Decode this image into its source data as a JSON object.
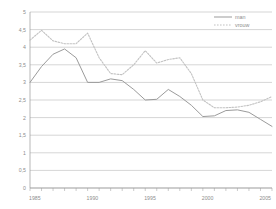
{
  "chart_data": {
    "type": "line",
    "title": "",
    "xlabel": "",
    "ylabel": "",
    "xlim": [
      1985,
      2006
    ],
    "ylim": [
      0,
      5
    ],
    "ytick_step": 0.5,
    "grid": true,
    "legend_position": "top-right",
    "ytick_labels": [
      "5",
      "4,5",
      "4",
      "3,5",
      "3",
      "2,5",
      "2",
      "1,5",
      "1",
      "0,5",
      "0"
    ],
    "ytick_values": [
      5,
      4.5,
      4,
      3.5,
      3,
      2.5,
      2,
      1.5,
      1,
      0.5,
      0
    ],
    "xtick_labels": [
      "1985",
      "1990",
      "1995",
      "2000",
      "2005"
    ],
    "xtick_values": [
      1985,
      1990,
      1995,
      2000,
      2005
    ],
    "x": [
      1985,
      1986,
      1987,
      1988,
      1989,
      1990,
      1991,
      1992,
      1993,
      1994,
      1995,
      1996,
      1997,
      1998,
      1999,
      2000,
      2001,
      2002,
      2003,
      2004,
      2005,
      2006
    ],
    "series": [
      {
        "name": "man",
        "style": "solid",
        "color": "#9b9b9b",
        "values": [
          3.0,
          3.45,
          3.8,
          3.95,
          3.7,
          3.0,
          3.0,
          3.1,
          3.05,
          2.8,
          2.5,
          2.52,
          2.8,
          2.6,
          2.35,
          2.03,
          2.05,
          2.2,
          2.22,
          2.15,
          1.95,
          1.75
        ]
      },
      {
        "name": "vrouw",
        "style": "dotted",
        "color": "#c2c2c2",
        "values": [
          4.2,
          4.48,
          4.18,
          4.1,
          4.1,
          4.4,
          3.7,
          3.25,
          3.22,
          3.5,
          3.9,
          3.55,
          3.65,
          3.7,
          3.25,
          2.5,
          2.28,
          2.28,
          2.3,
          2.35,
          2.45,
          2.6
        ]
      }
    ]
  },
  "legend": {
    "items": [
      {
        "label": "man",
        "style": "solid"
      },
      {
        "label": "vrouw",
        "style": "dotted"
      }
    ]
  }
}
